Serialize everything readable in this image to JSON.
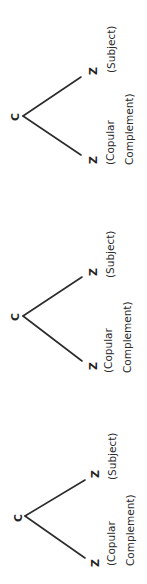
{
  "figure": {
    "orientation": "rotated-90-ccw",
    "line_color": "#2b2b2b",
    "trees": [
      {
        "root": "C",
        "upper_child": {
          "node": "Z",
          "label": "(Subject)"
        },
        "lower_child": {
          "node": "Z",
          "label_line1": "(Copular",
          "label_line2": "Complement)"
        }
      },
      {
        "root": "C",
        "upper_child": {
          "node": "Z",
          "label": "(Subject)"
        },
        "lower_child": {
          "node": "Z",
          "label_line1": "(Copular",
          "label_line2": "Complement)"
        }
      },
      {
        "root": "C",
        "upper_child": {
          "node": "Z",
          "label": "(Subject)"
        },
        "lower_child": {
          "node": "Z",
          "label_line1": "(Copular",
          "label_line2": "Complement)"
        }
      }
    ]
  }
}
